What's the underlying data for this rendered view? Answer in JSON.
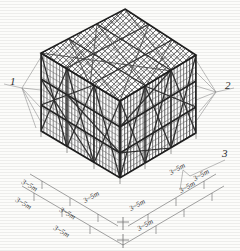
{
  "figure": {
    "type": "isometric-structural-diagram",
    "bays_x": 3,
    "bays_y": 3,
    "lift_levels": 3
  },
  "callouts": [
    {
      "id": "callout-1",
      "label": "1",
      "position": "left"
    },
    {
      "id": "callout-2",
      "label": "2",
      "position": "right"
    },
    {
      "id": "callout-3",
      "label": "3",
      "position": "lower-right"
    }
  ],
  "dimensions": {
    "spacing_label": "3~5m",
    "left_axis": [
      "3~5m",
      "3~5m",
      "3~5m"
    ],
    "right_axis": [
      "3~5m",
      "3~5m",
      "3~5m"
    ]
  },
  "colors": {
    "ink": "#3a3a3a",
    "frame": "#2b2b2b",
    "brace": "#4a4a4a",
    "thin": "#6e6e6e",
    "leader": "#8a8a8a",
    "paper": "#fcfcfa"
  }
}
